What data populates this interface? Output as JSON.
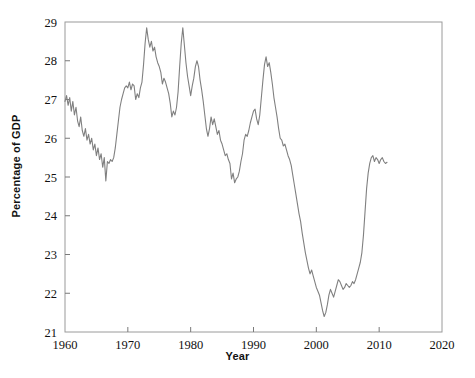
{
  "chart_data": {
    "type": "line",
    "title": "",
    "xlabel": "Year",
    "ylabel": "Percentage of GDP",
    "xlim": [
      1960,
      2020
    ],
    "ylim": [
      21,
      29
    ],
    "xticks": [
      1960,
      1970,
      1980,
      1990,
      2000,
      2010,
      2020
    ],
    "yticks": [
      21,
      22,
      23,
      24,
      25,
      26,
      27,
      28,
      29
    ],
    "grid": false,
    "legend": null,
    "line_color": "#808080",
    "series": [
      {
        "name": "Percentage of GDP",
        "x": [
          1960.0,
          1960.25,
          1960.5,
          1960.75,
          1961.0,
          1961.25,
          1961.5,
          1961.75,
          1962.0,
          1962.25,
          1962.5,
          1962.75,
          1963.0,
          1963.25,
          1963.5,
          1963.75,
          1964.0,
          1964.25,
          1964.5,
          1964.75,
          1965.0,
          1965.25,
          1965.5,
          1965.75,
          1966.0,
          1966.25,
          1966.5,
          1966.75,
          1967.0,
          1967.25,
          1967.5,
          1967.75,
          1968.0,
          1968.25,
          1968.5,
          1968.75,
          1969.0,
          1969.25,
          1969.5,
          1969.75,
          1970.0,
          1970.25,
          1970.5,
          1970.75,
          1971.0,
          1971.25,
          1971.5,
          1971.75,
          1972.0,
          1972.25,
          1972.5,
          1972.75,
          1973.0,
          1973.25,
          1973.5,
          1973.75,
          1974.0,
          1974.25,
          1974.5,
          1974.75,
          1975.0,
          1975.25,
          1975.5,
          1975.75,
          1976.0,
          1976.25,
          1976.5,
          1976.75,
          1977.0,
          1977.25,
          1977.5,
          1977.75,
          1978.0,
          1978.25,
          1978.5,
          1978.75,
          1979.0,
          1979.25,
          1979.5,
          1979.75,
          1980.0,
          1980.25,
          1980.5,
          1980.75,
          1981.0,
          1981.25,
          1981.5,
          1981.75,
          1982.0,
          1982.25,
          1982.5,
          1982.75,
          1983.0,
          1983.25,
          1983.5,
          1983.75,
          1984.0,
          1984.25,
          1984.5,
          1984.75,
          1985.0,
          1985.25,
          1985.5,
          1985.75,
          1986.0,
          1986.25,
          1986.5,
          1986.75,
          1987.0,
          1987.25,
          1987.5,
          1987.75,
          1988.0,
          1988.25,
          1988.5,
          1988.75,
          1989.0,
          1989.25,
          1989.5,
          1989.75,
          1990.0,
          1990.25,
          1990.5,
          1990.75,
          1991.0,
          1991.25,
          1991.5,
          1991.75,
          1992.0,
          1992.25,
          1992.5,
          1992.75,
          1993.0,
          1993.25,
          1993.5,
          1993.75,
          1994.0,
          1994.25,
          1994.5,
          1994.75,
          1995.0,
          1995.25,
          1995.5,
          1995.75,
          1996.0,
          1996.25,
          1996.5,
          1996.75,
          1997.0,
          1997.25,
          1997.5,
          1997.75,
          1998.0,
          1998.25,
          1998.5,
          1998.75,
          1999.0,
          1999.25,
          1999.5,
          1999.75,
          2000.0,
          2000.25,
          2000.5,
          2000.75,
          2001.0,
          2001.25,
          2001.5,
          2001.75,
          2002.0,
          2002.25,
          2002.5,
          2002.75,
          2003.0,
          2003.25,
          2003.5,
          2003.75,
          2004.0,
          2004.25,
          2004.5,
          2004.75,
          2005.0,
          2005.25,
          2005.5,
          2005.75,
          2006.0,
          2006.25,
          2006.5,
          2006.75,
          2007.0,
          2007.25,
          2007.5,
          2007.75,
          2008.0,
          2008.25,
          2008.5,
          2008.75,
          2009.0,
          2009.25,
          2009.5,
          2009.75,
          2010.0,
          2010.25,
          2010.5,
          2010.75,
          2011.0,
          2011.25
        ],
        "y": [
          26.95,
          27.1,
          26.85,
          27.05,
          26.7,
          26.95,
          26.6,
          26.8,
          26.45,
          26.3,
          26.55,
          26.2,
          26.05,
          26.25,
          25.95,
          26.1,
          25.85,
          26.0,
          25.7,
          25.85,
          25.55,
          25.75,
          25.45,
          25.6,
          25.25,
          25.5,
          24.9,
          25.4,
          25.35,
          25.45,
          25.4,
          25.5,
          25.75,
          26.1,
          26.45,
          26.8,
          27.0,
          27.15,
          27.3,
          27.35,
          27.3,
          27.45,
          27.25,
          27.4,
          27.35,
          27.0,
          27.15,
          27.05,
          27.3,
          27.45,
          27.9,
          28.45,
          28.85,
          28.55,
          28.35,
          28.5,
          28.25,
          28.35,
          28.1,
          27.95,
          27.85,
          27.7,
          27.4,
          27.55,
          27.45,
          27.3,
          27.15,
          26.9,
          26.55,
          26.7,
          26.6,
          26.8,
          27.2,
          27.85,
          28.45,
          28.85,
          28.4,
          27.95,
          27.6,
          27.35,
          27.1,
          27.35,
          27.55,
          27.85,
          28.0,
          27.85,
          27.5,
          27.25,
          26.95,
          26.6,
          26.25,
          26.05,
          26.25,
          26.55,
          26.35,
          26.5,
          26.3,
          26.1,
          26.2,
          25.95,
          25.85,
          25.7,
          25.55,
          25.6,
          25.45,
          25.35,
          24.95,
          25.1,
          24.85,
          24.95,
          25.0,
          25.15,
          25.4,
          25.6,
          25.95,
          26.1,
          26.05,
          26.2,
          26.4,
          26.55,
          26.7,
          26.75,
          26.5,
          26.35,
          26.6,
          27.05,
          27.5,
          27.9,
          28.1,
          27.85,
          27.95,
          27.7,
          27.4,
          27.05,
          26.8,
          26.55,
          26.25,
          26.0,
          25.95,
          25.8,
          25.85,
          25.7,
          25.55,
          25.45,
          25.3,
          25.05,
          24.8,
          24.55,
          24.3,
          24.05,
          23.85,
          23.55,
          23.3,
          23.05,
          22.85,
          22.65,
          22.5,
          22.6,
          22.45,
          22.3,
          22.15,
          22.05,
          21.95,
          21.75,
          21.55,
          21.4,
          21.5,
          21.7,
          21.95,
          22.1,
          22.0,
          21.9,
          22.05,
          22.2,
          22.35,
          22.3,
          22.2,
          22.1,
          22.15,
          22.25,
          22.2,
          22.15,
          22.2,
          22.3,
          22.25,
          22.35,
          22.5,
          22.65,
          22.8,
          23.05,
          23.5,
          24.1,
          24.7,
          25.1,
          25.35,
          25.5,
          25.55,
          25.4,
          25.5,
          25.45,
          25.35,
          25.45,
          25.5,
          25.4,
          25.35,
          25.38
        ]
      }
    ]
  },
  "axes": {
    "xtick_labels": [
      "1960",
      "1970",
      "1980",
      "1990",
      "2000",
      "2010",
      "2020"
    ],
    "ytick_labels": [
      "21",
      "22",
      "23",
      "24",
      "25",
      "26",
      "27",
      "28",
      "29"
    ],
    "xlabel_text": "Year",
    "ylabel_text": "Percentage of GDP"
  }
}
